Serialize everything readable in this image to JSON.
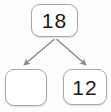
{
  "diagram": {
    "type": "number-bond",
    "background_color": "#fdfdfd",
    "box_border_color": "#a9a9a9",
    "box_fill_color": "#ffffff",
    "text_color": "#1a1a1a",
    "arrow_color": "#8a8a8a",
    "nodes": [
      {
        "id": "whole",
        "role": "whole",
        "value": "18",
        "empty": false,
        "x": 31,
        "y": 4,
        "width": 47,
        "height": 33
      },
      {
        "id": "part-left",
        "role": "part",
        "value": "",
        "empty": true,
        "x": 5,
        "y": 69,
        "width": 42,
        "height": 37
      },
      {
        "id": "part-right",
        "role": "part",
        "value": "12",
        "empty": false,
        "x": 63,
        "y": 69,
        "width": 44,
        "height": 36
      }
    ],
    "arrows": [
      {
        "id": "arrow-to-left-part",
        "from": "whole",
        "to": "part-left",
        "direction": "down-left",
        "x1": 54,
        "y1": 39,
        "x2": 23,
        "y2": 66
      },
      {
        "id": "arrow-to-right-part",
        "from": "whole",
        "to": "part-right",
        "direction": "down-right",
        "x1": 57,
        "y1": 39,
        "x2": 87,
        "y2": 66
      }
    ]
  }
}
